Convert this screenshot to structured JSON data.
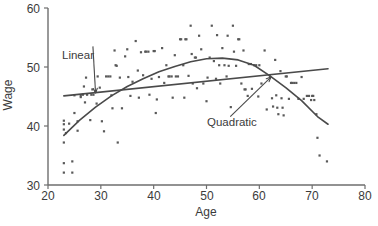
{
  "chart_data": {
    "type": "scatter",
    "title": "",
    "xlabel": "Age",
    "ylabel": "Wage",
    "xlim": [
      20,
      80
    ],
    "ylim": [
      30,
      60
    ],
    "xticks": [
      20,
      30,
      40,
      50,
      60,
      70,
      80
    ],
    "yticks": [
      30,
      40,
      50,
      60
    ],
    "grid": false,
    "legend_position": "none",
    "point_color": "#595959",
    "line_color": "#4a4a4a",
    "annotations": [
      {
        "name": "linear",
        "text": "Linear",
        "text_x": 28.5,
        "text_y": 53.5,
        "arrow_to_x": 29.0,
        "arrow_to_y": 45.6
      },
      {
        "name": "quadratic",
        "text": "Quadratic",
        "text_x": 54.5,
        "text_y": 41.6,
        "arrow_to_x": 62.2,
        "arrow_to_y": 48.3
      }
    ],
    "series": [
      {
        "name": "Linear fit",
        "type": "line",
        "x": [
          23.0,
          73.0
        ],
        "y": [
          45.1,
          49.7
        ]
      },
      {
        "name": "Quadratic fit",
        "type": "line",
        "x": [
          23.0,
          26.0,
          29.0,
          32.0,
          35.0,
          38.0,
          41.0,
          44.0,
          47.0,
          50.0,
          53.0,
          56.0,
          59.0,
          62.0,
          65.0,
          68.0,
          71.0,
          73.0
        ],
        "y": [
          38.4,
          41.0,
          43.2,
          45.1,
          46.7,
          48.0,
          49.2,
          50.1,
          50.9,
          51.4,
          51.5,
          51.2,
          50.3,
          48.5,
          46.5,
          44.3,
          41.6,
          40.3
        ]
      },
      {
        "name": "Observations",
        "type": "scatter",
        "points": [
          [
            23.0,
            39.4
          ],
          [
            23.0,
            40.3
          ],
          [
            23.0,
            40.9
          ],
          [
            23.0,
            37.2
          ],
          [
            23.0,
            33.7
          ],
          [
            23.0,
            32.1
          ],
          [
            23.4,
            38.8
          ],
          [
            24.0,
            40.4
          ],
          [
            24.6,
            34.0
          ],
          [
            24.6,
            32.1
          ],
          [
            25.0,
            42.2
          ],
          [
            25.0,
            45.2
          ],
          [
            25.6,
            40.8
          ],
          [
            25.6,
            39.2
          ],
          [
            26.2,
            44.9
          ],
          [
            26.2,
            45.2
          ],
          [
            26.6,
            45.3
          ],
          [
            26.8,
            46.7
          ],
          [
            27.0,
            44.0
          ],
          [
            27.2,
            48.2
          ],
          [
            27.4,
            45.3
          ],
          [
            28.0,
            41.0
          ],
          [
            28.2,
            45.3
          ],
          [
            28.4,
            46.2
          ],
          [
            28.6,
            45.3
          ],
          [
            29.0,
            45.9
          ],
          [
            29.2,
            43.8
          ],
          [
            29.4,
            48.4
          ],
          [
            29.8,
            46.5
          ],
          [
            30.2,
            40.8
          ],
          [
            30.6,
            39.1
          ],
          [
            31.0,
            48.4
          ],
          [
            31.4,
            48.4
          ],
          [
            31.8,
            48.4
          ],
          [
            32.0,
            45.2
          ],
          [
            32.2,
            43.0
          ],
          [
            32.6,
            52.8
          ],
          [
            32.8,
            50.3
          ],
          [
            33.0,
            50.2
          ],
          [
            33.2,
            37.2
          ],
          [
            33.6,
            48.2
          ],
          [
            34.0,
            43.0
          ],
          [
            34.6,
            51.8
          ],
          [
            35.0,
            53.0
          ],
          [
            35.2,
            48.3
          ],
          [
            35.6,
            45.1
          ],
          [
            36.0,
            47.5
          ],
          [
            36.6,
            54.4
          ],
          [
            37.0,
            49.4
          ],
          [
            37.2,
            44.8
          ],
          [
            37.6,
            52.5
          ],
          [
            38.0,
            48.6
          ],
          [
            38.4,
            52.6
          ],
          [
            38.6,
            52.6
          ],
          [
            39.0,
            52.6
          ],
          [
            39.2,
            45.3
          ],
          [
            39.6,
            48.0
          ],
          [
            40.0,
            52.7
          ],
          [
            40.2,
            52.7
          ],
          [
            40.4,
            42.2
          ],
          [
            40.6,
            44.5
          ],
          [
            41.0,
            48.3
          ],
          [
            41.6,
            53.2
          ],
          [
            42.0,
            47.3
          ],
          [
            42.4,
            50.3
          ],
          [
            42.8,
            48.4
          ],
          [
            43.0,
            48.4
          ],
          [
            43.4,
            48.4
          ],
          [
            43.6,
            44.8
          ],
          [
            44.0,
            52.0
          ],
          [
            44.2,
            48.4
          ],
          [
            44.6,
            48.4
          ],
          [
            45.0,
            54.7
          ],
          [
            45.2,
            54.7
          ],
          [
            45.6,
            50.3
          ],
          [
            45.8,
            44.8
          ],
          [
            46.0,
            54.7
          ],
          [
            46.2,
            54.7
          ],
          [
            46.6,
            48.5
          ],
          [
            47.0,
            57.0
          ],
          [
            47.2,
            52.2
          ],
          [
            47.4,
            47.2
          ],
          [
            47.8,
            51.6
          ],
          [
            48.0,
            51.6
          ],
          [
            48.2,
            46.4
          ],
          [
            48.6,
            55.3
          ],
          [
            49.0,
            53.0
          ],
          [
            49.4,
            47.2
          ],
          [
            50.0,
            44.2
          ],
          [
            50.2,
            48.2
          ],
          [
            50.6,
            51.6
          ],
          [
            51.0,
            57.0
          ],
          [
            51.4,
            51.0
          ],
          [
            51.8,
            48.0
          ],
          [
            52.0,
            55.4
          ],
          [
            52.4,
            50.3
          ],
          [
            52.6,
            47.2
          ],
          [
            53.0,
            53.2
          ],
          [
            53.4,
            50.3
          ],
          [
            53.8,
            48.4
          ],
          [
            54.0,
            55.3
          ],
          [
            54.2,
            50.2
          ],
          [
            54.6,
            43.2
          ],
          [
            55.0,
            57.0
          ],
          [
            55.2,
            52.6
          ],
          [
            55.6,
            50.2
          ],
          [
            56.0,
            54.7
          ],
          [
            56.2,
            54.7
          ],
          [
            56.6,
            47.2
          ],
          [
            57.0,
            52.8
          ],
          [
            57.2,
            46.2
          ],
          [
            57.4,
            46.2
          ],
          [
            57.8,
            45.1
          ],
          [
            58.0,
            50.5
          ],
          [
            58.4,
            50.5
          ],
          [
            58.6,
            46.3
          ],
          [
            59.0,
            50.3
          ],
          [
            59.4,
            50.3
          ],
          [
            59.8,
            45.0
          ],
          [
            60.0,
            50.3
          ],
          [
            60.4,
            47.2
          ],
          [
            61.0,
            52.8
          ],
          [
            61.4,
            42.8
          ],
          [
            62.0,
            48.4
          ],
          [
            62.4,
            44.7
          ],
          [
            62.6,
            43.3
          ],
          [
            63.0,
            51.2
          ],
          [
            63.2,
            45.2
          ],
          [
            63.4,
            43.1
          ],
          [
            63.6,
            42.0
          ],
          [
            64.0,
            49.3
          ],
          [
            64.2,
            44.7
          ],
          [
            64.4,
            43.1
          ],
          [
            64.6,
            41.8
          ],
          [
            65.0,
            48.4
          ],
          [
            65.2,
            48.4
          ],
          [
            65.6,
            44.6
          ],
          [
            66.0,
            47.3
          ],
          [
            66.2,
            47.3
          ],
          [
            66.6,
            47.3
          ],
          [
            67.0,
            47.3
          ],
          [
            67.4,
            44.6
          ],
          [
            68.0,
            48.3
          ],
          [
            68.4,
            44.6
          ],
          [
            69.0,
            45.1
          ],
          [
            69.4,
            45.1
          ],
          [
            69.8,
            44.4
          ],
          [
            70.0,
            45.1
          ],
          [
            70.2,
            45.1
          ],
          [
            70.4,
            44.4
          ],
          [
            70.8,
            42.0
          ],
          [
            71.0,
            38.0
          ],
          [
            71.4,
            35.0
          ],
          [
            72.8,
            34.0
          ]
        ]
      }
    ]
  },
  "axes": {
    "x_tick_labels": [
      "20",
      "30",
      "40",
      "50",
      "60",
      "70",
      "80"
    ],
    "y_tick_labels": [
      "30",
      "40",
      "50",
      "60"
    ],
    "x_title": "Age",
    "y_title": "Wage"
  },
  "annotation_labels": {
    "linear": "Linear",
    "quadratic": "Quadratic"
  }
}
